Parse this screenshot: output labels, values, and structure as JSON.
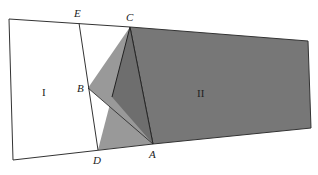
{
  "diagram": {
    "colors": {
      "background": "#ffffff",
      "outline": "#333333",
      "region_II_fill": "#777777",
      "triangle_light_fill": "#999999",
      "triangle_mid_fill": "#6e6e6e"
    },
    "points": {
      "TL": [
        9,
        19
      ],
      "BL": [
        13,
        160
      ],
      "E": [
        79,
        23
      ],
      "C": [
        130,
        27
      ],
      "B": [
        88,
        88
      ],
      "D": [
        98,
        150
      ],
      "A": [
        153,
        144
      ],
      "TR": [
        308,
        41
      ],
      "BR": [
        311,
        128
      ]
    },
    "labels": {
      "E": "E",
      "C": "C",
      "B": "B",
      "D": "D",
      "A": "A",
      "region_I": "I",
      "region_II": "II"
    }
  }
}
